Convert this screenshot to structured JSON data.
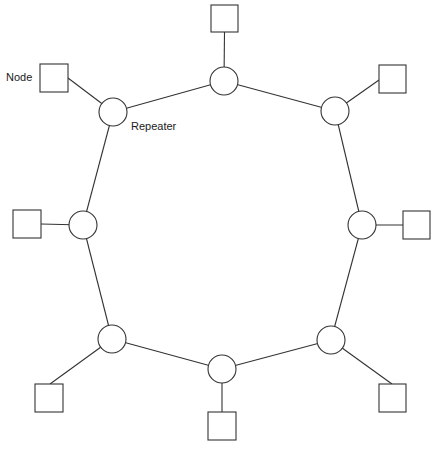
{
  "diagram": {
    "type": "ring-topology",
    "labels": {
      "node": "Node",
      "repeater": "Repeater"
    },
    "colors": {
      "stroke": "#333333",
      "fill": "#ffffff"
    },
    "stations": [
      {
        "id": "top",
        "repeater": [
          224,
          81
        ],
        "node": [
          211,
          5
        ]
      },
      {
        "id": "top-right",
        "repeater": [
          335,
          111
        ],
        "node": [
          379,
          65
        ]
      },
      {
        "id": "right",
        "repeater": [
          362,
          225
        ],
        "node": [
          403,
          211
        ]
      },
      {
        "id": "bottom-right",
        "repeater": [
          331,
          340
        ],
        "node": [
          379,
          384
        ]
      },
      {
        "id": "bottom",
        "repeater": [
          222,
          369
        ],
        "node": [
          208,
          412
        ]
      },
      {
        "id": "bottom-left",
        "repeater": [
          112,
          339
        ],
        "node": [
          35,
          384
        ]
      },
      {
        "id": "left",
        "repeater": [
          83,
          225
        ],
        "node": [
          13,
          210
        ]
      },
      {
        "id": "top-left",
        "repeater": [
          113,
          112
        ],
        "node": [
          40,
          64
        ]
      }
    ]
  }
}
